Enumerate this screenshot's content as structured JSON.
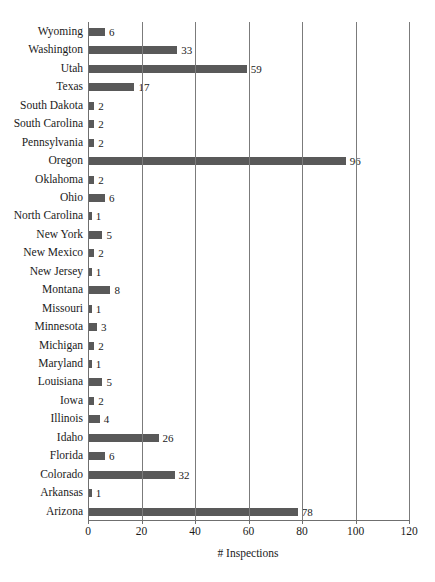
{
  "chart_data": {
    "type": "bar",
    "orientation": "horizontal",
    "title": "",
    "xlabel": "# Inspections",
    "ylabel": "",
    "xlim": [
      0,
      120
    ],
    "xticks": [
      0,
      20,
      40,
      60,
      80,
      100,
      120
    ],
    "grid": "vertical",
    "legend": null,
    "bar_color": "#595959",
    "gridline_color": "#7b7b7b",
    "categories": [
      "Wyoming",
      "Washington",
      "Utah",
      "Texas",
      "South Dakota",
      "South Carolina",
      "Pennsylvania",
      "Oregon",
      "Oklahoma",
      "Ohio",
      "North Carolina",
      "New York",
      "New Mexico",
      "New Jersey",
      "Montana",
      "Missouri",
      "Minnesota",
      "Michigan",
      "Maryland",
      "Louisiana",
      "Iowa",
      "Illinois",
      "Idaho",
      "Florida",
      "Colorado",
      "Arkansas",
      "Arizona"
    ],
    "values": [
      6,
      33,
      59,
      17,
      2,
      2,
      2,
      96,
      2,
      6,
      1,
      5,
      2,
      1,
      8,
      1,
      3,
      2,
      1,
      5,
      2,
      4,
      26,
      6,
      32,
      1,
      78
    ],
    "value_labels": [
      "6",
      "33",
      "59",
      "17",
      "2",
      "2",
      "2",
      "96",
      "2",
      "6",
      "1",
      "5",
      "2",
      "1",
      "8",
      "1",
      "3",
      "2",
      "1",
      "5",
      "2",
      "4",
      "26",
      "6",
      "32",
      "1",
      "78"
    ]
  }
}
